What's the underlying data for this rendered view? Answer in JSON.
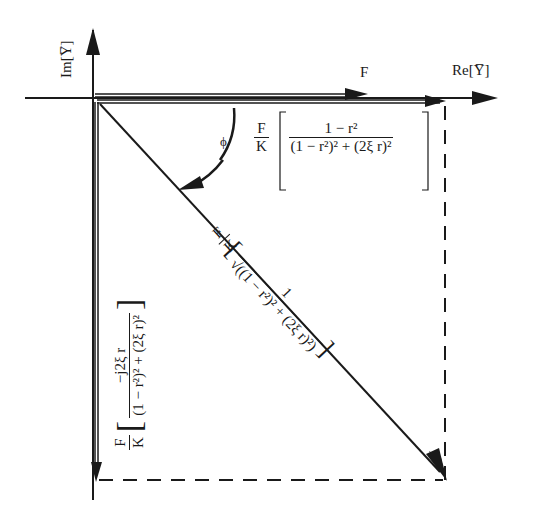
{
  "axes": {
    "imag_label": "Im[Y̅]",
    "real_label": "Re[Y̅]"
  },
  "vectors": {
    "force_label": "F",
    "phase_label": "ϕ"
  },
  "expressions": {
    "real_part": {
      "prefix_num": "F",
      "prefix_den": "K",
      "num": "1 − r²",
      "den": "(1 − r²)² + (2ξ r)²"
    },
    "imag_part": {
      "prefix_num": "F",
      "prefix_den": "K",
      "num": "−j2ξ r",
      "den": "(1 − r²)² + (2ξ r)²"
    },
    "magnitude": {
      "prefix_num": "F",
      "prefix_den": "K",
      "num": "1",
      "den": "√((1 − r²)² + (2ξ r)²)"
    }
  },
  "colors": {
    "ink": "#1a1a1a",
    "background": "#ffffff"
  }
}
